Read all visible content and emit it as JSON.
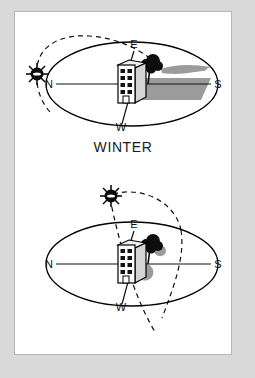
{
  "figure": {
    "background_color": "#d9d9d9",
    "panel_color": "#ffffff",
    "panel_border_color": "#b6b6b6",
    "ink_color": "#111111",
    "shadow_color": "#9b9b9b"
  },
  "diagrams": [
    {
      "id": "winter",
      "caption": "WINTER",
      "compass": {
        "north": "N",
        "south": "S",
        "east": "E",
        "west": "W"
      },
      "sun": {
        "icon": "sun-icon",
        "position": "low-on-northeast-horizon",
        "altitude_description": "low",
        "path_description": "shallow low arc"
      },
      "shadow": {
        "length_description": "long",
        "direction": "toward south"
      },
      "objects": {
        "building": "building-icon",
        "tree": "tree-icon"
      }
    },
    {
      "id": "summer",
      "caption": "SUMMER",
      "compass": {
        "north": "N",
        "south": "S",
        "east": "E",
        "west": "W"
      },
      "sun": {
        "icon": "sun-icon",
        "position": "high-overhead",
        "altitude_description": "high",
        "path_description": "steep high arc"
      },
      "shadow": {
        "length_description": "short",
        "direction": "toward south"
      },
      "objects": {
        "building": "building-icon",
        "tree": "tree-icon"
      }
    }
  ]
}
